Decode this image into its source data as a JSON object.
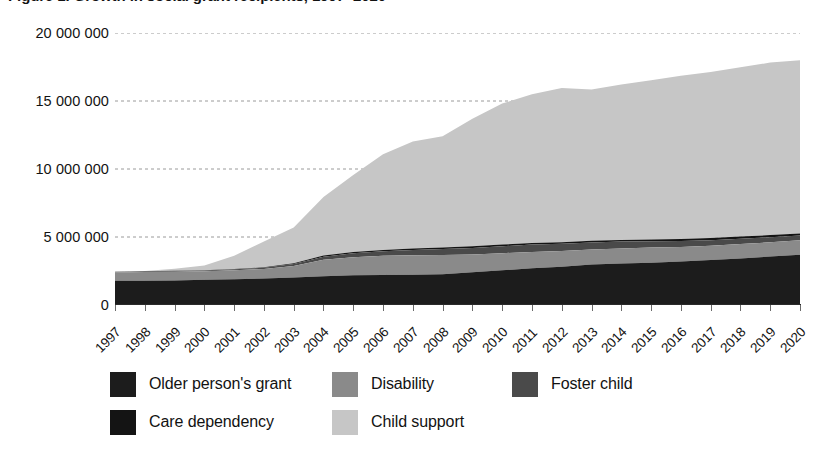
{
  "chart_data": {
    "type": "area",
    "stacked": true,
    "title": "Figure 1. Growth in social grant recipients, 1997–2020",
    "xlabel": "",
    "ylabel": "",
    "grid": true,
    "legend_position": "bottom",
    "ylim": [
      0,
      20000000
    ],
    "yticks": [
      0,
      5000000,
      10000000,
      15000000,
      20000000
    ],
    "ytick_labels": [
      "0",
      "5 000 000",
      "10 000 000",
      "15 000 000",
      "20 000 000"
    ],
    "categories": [
      "1997",
      "1998",
      "1999",
      "2000",
      "2001",
      "2002",
      "2003",
      "2004",
      "2005",
      "2006",
      "2007",
      "2008",
      "2009",
      "2010",
      "2011",
      "2012",
      "2013",
      "2014",
      "2015",
      "2016",
      "2017",
      "2018",
      "2019",
      "2020"
    ],
    "series": [
      {
        "name": "Older person's grant",
        "color": "#1c1c1c",
        "values": [
          1790000,
          1790000,
          1810000,
          1860000,
          1900000,
          1950000,
          2020000,
          2110000,
          2190000,
          2200000,
          2220000,
          2260000,
          2410000,
          2550000,
          2700000,
          2810000,
          2970000,
          3050000,
          3110000,
          3200000,
          3300000,
          3420000,
          3560000,
          3700000
        ]
      },
      {
        "name": "Disability",
        "color": "#8a8a8a",
        "values": [
          600000,
          640000,
          640000,
          630000,
          660000,
          700000,
          850000,
          1210000,
          1320000,
          1420000,
          1430000,
          1410000,
          1300000,
          1260000,
          1200000,
          1160000,
          1120000,
          1110000,
          1110000,
          1070000,
          1050000,
          1060000,
          1050000,
          1060000
        ]
      },
      {
        "name": "Foster child",
        "color": "#4a4a4a",
        "values": [
          43000,
          45000,
          48000,
          55000,
          65000,
          85000,
          140000,
          230000,
          290000,
          330000,
          400000,
          450000,
          490000,
          510000,
          540000,
          530000,
          510000,
          500000,
          470000,
          440000,
          420000,
          400000,
          380000,
          350000
        ]
      },
      {
        "name": "Care dependency",
        "color": "#141414",
        "values": [
          9000,
          10000,
          12000,
          18000,
          25000,
          34000,
          58000,
          85000,
          94000,
          99000,
          103000,
          107000,
          111000,
          120000,
          121000,
          120000,
          120000,
          126000,
          130000,
          140000,
          148000,
          150000,
          152000,
          155000
        ]
      },
      {
        "name": "Child support",
        "color": "#c6c6c6",
        "values": [
          0,
          22000,
          150000,
          350000,
          970000,
          1900000,
          2630000,
          4310000,
          5660000,
          7040000,
          7860000,
          8190000,
          9380000,
          10370000,
          10930000,
          11340000,
          11130000,
          11420000,
          11700000,
          12000000,
          12210000,
          12450000,
          12680000,
          12740000
        ]
      }
    ],
    "totals": [
      2442000,
      2507000,
      2660000,
      2913000,
      3620000,
      4669000,
      5698000,
      7945000,
      9554000,
      11089000,
      12013000,
      12417000,
      13691000,
      14810000,
      15491000,
      15960000,
      15850000,
      16206000,
      16520000,
      16850000,
      17128000,
      17480000,
      17822000,
      18005000
    ]
  },
  "legend": {
    "items": [
      {
        "label": "Older person's grant",
        "color": "#1c1c1c"
      },
      {
        "label": "Disability",
        "color": "#8a8a8a"
      },
      {
        "label": "Foster child",
        "color": "#4a4a4a"
      },
      {
        "label": "Care dependency",
        "color": "#141414"
      },
      {
        "label": "Child support",
        "color": "#c6c6c6"
      }
    ]
  }
}
